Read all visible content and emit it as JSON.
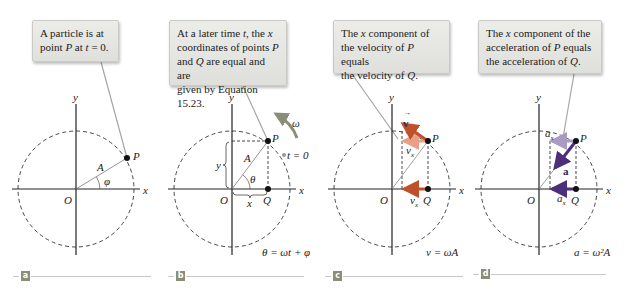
{
  "figure": {
    "panels": [
      {
        "id": "a",
        "tag": "a",
        "callout": {
          "line1_a": "A particle is at",
          "line2_a": "point ",
          "line2_b": "P",
          "line2_c": " at ",
          "line2_d": "t",
          "line2_e": " = 0."
        },
        "labels": {
          "y": "y",
          "x": "x",
          "O": "O",
          "P": "P",
          "A": "A",
          "phi": "φ"
        }
      },
      {
        "id": "b",
        "tag": "b",
        "callout": {
          "l1a": "At a later time ",
          "l1b": "t",
          "l1c": ", the ",
          "l1d": "x",
          "l2a": "coordinates of points ",
          "l2b": "P",
          "l3a": "and ",
          "l3b": "Q",
          "l3c": " are equal and are",
          "l4": "given by Equation 15.23."
        },
        "labels": {
          "y": "y",
          "x": "x",
          "O": "O",
          "P": "P",
          "Q": "Q",
          "A": "A",
          "theta": "θ",
          "ybrace": "y",
          "xbrace": "x",
          "omega": "ω",
          "t0": "t = 0",
          "equation": "θ = ωt + φ"
        }
      },
      {
        "id": "c",
        "tag": "c",
        "callout": {
          "l1a": "The ",
          "l1b": "x",
          "l1c": " component of",
          "l2a": "the velocity of ",
          "l2b": "P",
          "l2c": " equals",
          "l3a": "the velocity of ",
          "l3b": "Q",
          "l3c": "."
        },
        "labels": {
          "y": "y",
          "x": "x",
          "O": "O",
          "P": "P",
          "Q": "Q",
          "v": "v",
          "vx_top": "v",
          "vx_bottom": "v",
          "sub_x": "x",
          "equation": "v = ωA"
        }
      },
      {
        "id": "d",
        "tag": "d",
        "callout": {
          "l1a": "The ",
          "l1b": "x",
          "l1c": " component of the",
          "l2a": "acceleration of ",
          "l2b": "P",
          "l2c": " equals",
          "l3a": "the acceleration of ",
          "l3b": "Q",
          "l3c": "."
        },
        "labels": {
          "y": "y",
          "x": "x",
          "O": "O",
          "P": "P",
          "Q": "Q",
          "a": "a",
          "ax_top": "a",
          "ax_bottom": "a",
          "sub_x": "x",
          "equation": "a = ω²A"
        }
      }
    ],
    "colors": {
      "velocity_arrow": "#c0502a",
      "velocity_component": "#e8a088",
      "acceleration_arrow": "#4b2f7a",
      "acceleration_component": "#a89cc4",
      "callout_bg": "#e6e7e3",
      "tag_bg": "#8a8d78",
      "omega_arrow": "#8a8d78"
    }
  }
}
